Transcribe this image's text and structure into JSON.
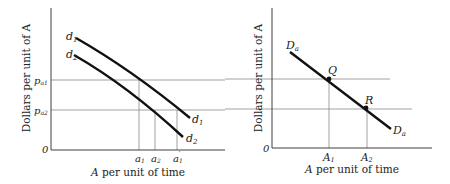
{
  "figure": {
    "left_panel": {
      "ylabel": "Dollars per unit of A",
      "xlabel": "A per unit of time",
      "origin_label": "0",
      "price_levels": [
        {
          "label": "p",
          "sub": "a1"
        },
        {
          "label": "p",
          "sub": "a2"
        }
      ],
      "quantity_ticks": [
        {
          "label": "a",
          "sub": "1",
          "prime": ""
        },
        {
          "label": "a",
          "sub": "2",
          "prime": ""
        },
        {
          "label": "a",
          "sub": "1",
          "prime": "′"
        }
      ],
      "curves": [
        {
          "name": "d",
          "sub": "1",
          "end_label": "d",
          "end_sub": "1"
        },
        {
          "name": "d",
          "sub": "2",
          "end_label": "d",
          "end_sub": "2"
        }
      ]
    },
    "right_panel": {
      "ylabel": "Dollars per unit of A",
      "xlabel": "A per unit of time",
      "origin_label": "0",
      "quantity_ticks": [
        {
          "label": "A",
          "sub": "1"
        },
        {
          "label": "A",
          "sub": "2"
        }
      ],
      "curve": {
        "name": "D",
        "sub": "a",
        "end_label": "D",
        "end_sub": "a"
      },
      "points": [
        "Q",
        "R"
      ]
    }
  }
}
